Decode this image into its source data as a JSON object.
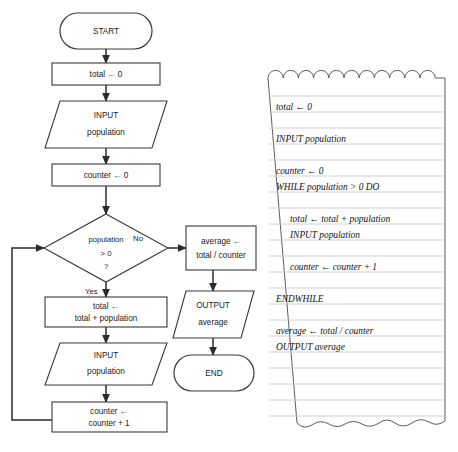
{
  "diagram": {
    "type": "flowchart",
    "flowchart": {
      "nodes": [
        {
          "id": "start",
          "shape": "terminator",
          "lines": [
            "START"
          ]
        },
        {
          "id": "total_init",
          "shape": "process",
          "lines": [
            "total ← 0"
          ]
        },
        {
          "id": "input_pop_1",
          "shape": "parallelogram",
          "lines": [
            "INPUT",
            "population"
          ]
        },
        {
          "id": "counter_init",
          "shape": "process",
          "lines": [
            "counter ← 0"
          ]
        },
        {
          "id": "decision",
          "shape": "diamond",
          "lines": [
            "population",
            "> 0",
            "?"
          ]
        },
        {
          "id": "total_acc",
          "shape": "process",
          "lines": [
            "total ←",
            "total + population"
          ]
        },
        {
          "id": "input_pop_2",
          "shape": "parallelogram",
          "lines": [
            "INPUT",
            "population"
          ]
        },
        {
          "id": "counter_inc",
          "shape": "process",
          "lines": [
            "counter ←",
            "counter + 1"
          ]
        },
        {
          "id": "average",
          "shape": "process",
          "lines": [
            "average ←",
            "total / counter"
          ]
        },
        {
          "id": "output_avg",
          "shape": "parallelogram",
          "lines": [
            "OUTPUT",
            "average"
          ]
        },
        {
          "id": "end",
          "shape": "terminator",
          "lines": [
            "END"
          ]
        }
      ],
      "branch_labels": {
        "yes": "Yes",
        "no": "No"
      }
    },
    "notepad": {
      "lines": [
        {
          "text": "total ← 0",
          "indent": 0
        },
        {
          "text": "",
          "indent": 0
        },
        {
          "text": "INPUT population",
          "indent": 0
        },
        {
          "text": "",
          "indent": 0
        },
        {
          "text": "counter ← 0",
          "indent": 0
        },
        {
          "text": "WHILE population > 0 DO",
          "indent": 0
        },
        {
          "text": "",
          "indent": 0
        },
        {
          "text": "total ← total + population",
          "indent": 1
        },
        {
          "text": "INPUT population",
          "indent": 1
        },
        {
          "text": "",
          "indent": 0
        },
        {
          "text": "counter ← counter + 1",
          "indent": 1
        },
        {
          "text": "",
          "indent": 0
        },
        {
          "text": "ENDWHILE",
          "indent": 0
        },
        {
          "text": "",
          "indent": 0
        },
        {
          "text": "average ← total / counter",
          "indent": 0
        },
        {
          "text": "OUTPUT average",
          "indent": 0
        },
        {
          "text": "",
          "indent": 0
        },
        {
          "text": "",
          "indent": 0
        },
        {
          "text": "",
          "indent": 0
        },
        {
          "text": "",
          "indent": 0
        },
        {
          "text": "",
          "indent": 0
        }
      ]
    },
    "colors": {
      "background": "#ffffff",
      "shape_stroke": "#3a3a3a",
      "connector": "#2b2b2b",
      "text": "#1a1a1a",
      "rule_line": "#c9cdd4",
      "paper_edge": "#5d5d5d"
    }
  }
}
